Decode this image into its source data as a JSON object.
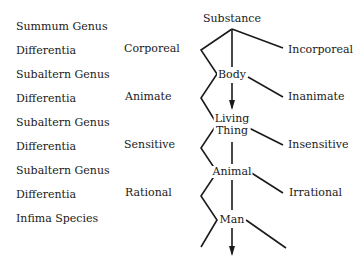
{
  "levels": [
    {
      "label": "Summum Genus"
    },
    {
      "label": "Differentia"
    },
    {
      "label": "Subaltern Genus"
    },
    {
      "label": "Differentia"
    },
    {
      "label": "Subaltern Genus"
    },
    {
      "label": "Differentia"
    },
    {
      "label": "Subaltern Genus"
    },
    {
      "label": "Differentia"
    },
    {
      "label": "Infima Species"
    }
  ],
  "tree": {
    "nodes": [
      {
        "label": "Substance"
      },
      {
        "label": "Body"
      },
      {
        "label_line1": "Living",
        "label_line2": "Thing"
      },
      {
        "label": "Animal"
      },
      {
        "label": "Man"
      }
    ],
    "left_differentiae": [
      {
        "label": "Corporeal"
      },
      {
        "label": "Animate"
      },
      {
        "label": "Sensitive"
      },
      {
        "label": "Rational"
      }
    ],
    "right_differentiae": [
      {
        "label": "Incorporeal"
      },
      {
        "label": "Inanimate"
      },
      {
        "label": "Insensitive"
      },
      {
        "label": "Irrational"
      }
    ]
  },
  "colors": {
    "line": "#1a1a1a",
    "text": "#1a1a1a",
    "background": "#ffffff"
  }
}
